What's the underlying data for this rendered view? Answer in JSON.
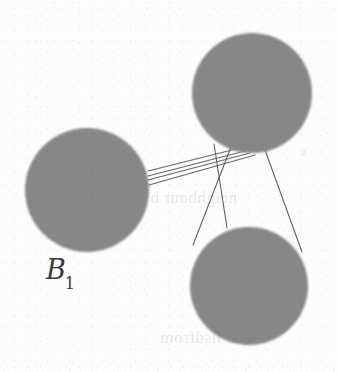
{
  "figure": {
    "kind": "graph-diagram",
    "medium": "scanned-book-page",
    "background_color": "#fdfdfc",
    "canvas": {
      "width": 339,
      "height": 372
    },
    "labels": [
      {
        "name": "label-b1",
        "base": "B",
        "subscript": "1",
        "full_text": "B1",
        "style": "italic-serif",
        "color": "#3a3a3a",
        "x": 46,
        "y": 256
      }
    ],
    "nodes": [
      {
        "name": "disk-left",
        "id": "B1",
        "label": "B1",
        "cx": 87,
        "cy": 190,
        "r": 62,
        "fill": "#8d8d8d",
        "texture": "dithered-halftone-gray"
      },
      {
        "name": "disk-top-right",
        "id": "top-right",
        "label": "",
        "cx": 252,
        "cy": 93,
        "r": 60,
        "fill": "#8d8d8d",
        "texture": "dithered-halftone-gray"
      },
      {
        "name": "disk-bottom-right",
        "id": "bottom-right",
        "label": "",
        "cx": 249,
        "cy": 286,
        "r": 59,
        "fill": "#8d8d8d",
        "texture": "dithered-halftone-gray"
      }
    ],
    "edges": [
      {
        "name": "edge-left-to-topright-1",
        "from": "B1",
        "to": "top-right",
        "x1": 148,
        "y1": 171,
        "x2": 240,
        "y2": 148
      },
      {
        "name": "edge-left-to-topright-2",
        "from": "B1",
        "to": "top-right",
        "x1": 148,
        "y1": 176,
        "x2": 244,
        "y2": 151
      },
      {
        "name": "edge-left-to-topright-3",
        "from": "B1",
        "to": "top-right",
        "x1": 148,
        "y1": 180,
        "x2": 249,
        "y2": 153
      },
      {
        "name": "edge-left-to-topright-4",
        "from": "B1",
        "to": "top-right",
        "x1": 149,
        "y1": 185,
        "x2": 254,
        "y2": 155
      },
      {
        "name": "edge-topright-to-bottomright-left",
        "from": "top-right",
        "to": "bottom-right",
        "x1": 229,
        "y1": 148,
        "x2": 194,
        "y2": 243
      },
      {
        "name": "edge-topright-to-bottomright-middle",
        "from": "top-right",
        "to": "bottom-right",
        "x1": 215,
        "y1": 145,
        "x2": 227,
        "y2": 228
      },
      {
        "name": "edge-topright-to-bottomright-right",
        "from": "top-right",
        "to": "bottom-right",
        "x1": 264,
        "y1": 150,
        "x2": 300,
        "y2": 250
      }
    ],
    "edge_style": {
      "stroke_color": "#5b5b5b",
      "stroke_width": 1.15
    },
    "bleed_through_text": [
      {
        "name": "bleed-text-mid",
        "text": "neighbour b",
        "x": 150,
        "y": 196,
        "size": 17
      },
      {
        "name": "bleed-text-bottom",
        "text": "du  llsdfrom",
        "x": 160,
        "y": 336,
        "size": 17
      },
      {
        "name": "bleed-text-upper",
        "text": "x",
        "x": 300,
        "y": 152,
        "size": 14
      }
    ]
  }
}
